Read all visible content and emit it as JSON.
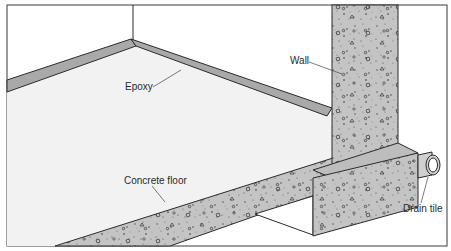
{
  "diagram": {
    "type": "cross-section illustration",
    "labels": {
      "epoxy": "Epoxy",
      "wall": "Wall",
      "concrete_floor": "Concrete floor",
      "drain_tile": "Drain tile"
    },
    "colors": {
      "concrete": "#c4c4c4",
      "epoxy": "#a9a9a9",
      "floor_surface": "#f2f2f2",
      "outline": "#2b2b2b",
      "background": "#ffffff"
    }
  }
}
